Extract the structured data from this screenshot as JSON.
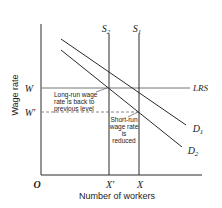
{
  "diagram": {
    "type": "labor-market-supply-demand",
    "axes": {
      "y_label": "Wage rate",
      "x_label": "Number of workers",
      "origin_label": "O"
    },
    "y_ticks": {
      "w": "W",
      "w_prime": "W'"
    },
    "x_ticks": {
      "x_prime": "X'",
      "x": "X"
    },
    "curves": {
      "s1": {
        "label": "S",
        "sub": "1"
      },
      "s2": {
        "label": "S",
        "sub": "2"
      },
      "d1": {
        "label": "D",
        "sub": "1"
      },
      "d2": {
        "label": "D",
        "sub": "2"
      },
      "lrs": {
        "label": "LRS"
      }
    },
    "annotations": {
      "long_run": [
        "Long-run wage",
        "rate is back to",
        "previous level"
      ],
      "short_run": [
        "Short-run",
        "wage rate",
        "is",
        "reduced"
      ]
    },
    "colors": {
      "line": "#2a2a2a",
      "text": "#222222",
      "background": "#ffffff"
    }
  }
}
